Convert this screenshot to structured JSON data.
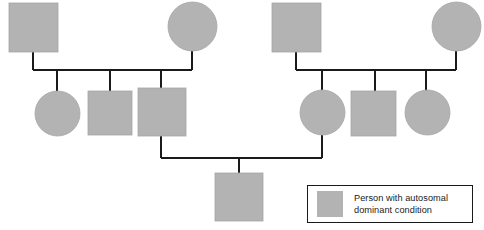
{
  "figure": {
    "kind": "pedigree-chart",
    "width": 484,
    "height": 230,
    "background_color": "#ffffff"
  },
  "style": {
    "affected_fill": "#b3b3b3",
    "affected_stroke": "#a6a6a6",
    "line_color": "#1a1a1a",
    "line_width": 1.6,
    "legend_border_color": "#1a1a1a",
    "legend_background": "#ffffff"
  },
  "legend": {
    "label": "Person with autosomal\ndominant condition",
    "swatch_shape": "square",
    "swatch_fill": "#b3b3b3",
    "box": {
      "x": 307,
      "y": 185,
      "width": 166,
      "height": 38
    },
    "swatch": {
      "width": 26,
      "height": 26
    }
  },
  "people": [
    {
      "id": "g1-left-father",
      "generation": 1,
      "family": "left",
      "shape": "square",
      "affected": true,
      "x": 9,
      "y": 3,
      "size": 49
    },
    {
      "id": "g1-left-mother",
      "generation": 1,
      "family": "left",
      "shape": "circle",
      "affected": true,
      "x": 168,
      "y": 2,
      "size": 49
    },
    {
      "id": "g1-right-father",
      "generation": 1,
      "family": "right",
      "shape": "square",
      "affected": true,
      "x": 272,
      "y": 3,
      "size": 49
    },
    {
      "id": "g1-right-mother",
      "generation": 1,
      "family": "right",
      "shape": "circle",
      "affected": true,
      "x": 432,
      "y": 2,
      "size": 49
    },
    {
      "id": "g2-left-child-1",
      "generation": 2,
      "family": "left",
      "shape": "circle",
      "affected": true,
      "x": 35,
      "y": 91,
      "size": 45
    },
    {
      "id": "g2-left-child-2",
      "generation": 2,
      "family": "left",
      "shape": "square",
      "affected": true,
      "x": 88,
      "y": 91,
      "size": 44
    },
    {
      "id": "g2-left-child-3",
      "generation": 2,
      "family": "left",
      "shape": "square",
      "affected": true,
      "x": 138,
      "y": 88,
      "size": 48
    },
    {
      "id": "g2-right-child-1",
      "generation": 2,
      "family": "right",
      "shape": "circle",
      "affected": true,
      "x": 300,
      "y": 90,
      "size": 45
    },
    {
      "id": "g2-right-child-2",
      "generation": 2,
      "family": "right",
      "shape": "square",
      "affected": true,
      "x": 351,
      "y": 91,
      "size": 45
    },
    {
      "id": "g2-right-child-3",
      "generation": 2,
      "family": "right",
      "shape": "circle",
      "affected": true,
      "x": 405,
      "y": 90,
      "size": 45
    },
    {
      "id": "g3-child",
      "generation": 3,
      "family": "union",
      "shape": "square",
      "affected": true,
      "x": 215,
      "y": 173,
      "size": 48
    }
  ],
  "connections": {
    "left_family": {
      "father_drop": {
        "x": 33,
        "y1": 52,
        "y2": 70
      },
      "mother_drop": {
        "x": 192,
        "y1": 51,
        "y2": 70
      },
      "sibship_line": {
        "x1": 33,
        "x2": 192,
        "y": 70
      },
      "child_drops": [
        {
          "x": 57,
          "y1": 70,
          "y2": 93
        },
        {
          "x": 110,
          "y1": 70,
          "y2": 91
        },
        {
          "x": 161,
          "y1": 70,
          "y2": 88
        }
      ]
    },
    "right_family": {
      "father_drop": {
        "x": 296,
        "y1": 52,
        "y2": 70
      },
      "mother_drop": {
        "x": 456,
        "y1": 51,
        "y2": 70
      },
      "sibship_line": {
        "x1": 296,
        "x2": 456,
        "y": 70
      },
      "child_drops": [
        {
          "x": 322,
          "y1": 70,
          "y2": 92
        },
        {
          "x": 375,
          "y1": 70,
          "y2": 91
        },
        {
          "x": 426,
          "y1": 70,
          "y2": 92
        }
      ]
    },
    "union": {
      "left_parent_drop": {
        "x": 161,
        "y1": 136,
        "y2": 158
      },
      "right_parent_drop": {
        "x": 322,
        "y1": 135,
        "y2": 158
      },
      "mating_line": {
        "x1": 161,
        "x2": 322,
        "y": 158
      },
      "child_drop": {
        "x": 239,
        "y1": 158,
        "y2": 173
      }
    }
  }
}
